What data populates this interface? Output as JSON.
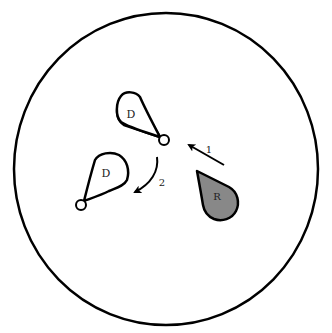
{
  "diagram": {
    "boundary": {
      "cx": 166,
      "cy": 169,
      "rx": 152,
      "ry": 156,
      "stroke": "#000000"
    },
    "shapes": [
      {
        "id": "D_upper",
        "label": "D",
        "fill": "#ffffff",
        "pivot": {
          "x": 163,
          "y": 140
        }
      },
      {
        "id": "D_lower",
        "label": "D",
        "fill": "#ffffff",
        "pivot": {
          "x": 81,
          "y": 205
        }
      },
      {
        "id": "R",
        "label": "R",
        "fill": "#888888"
      }
    ],
    "arrows": [
      {
        "id": "arrow_1",
        "label": "1",
        "type": "straight"
      },
      {
        "id": "arrow_2",
        "label": "2",
        "type": "curved"
      }
    ]
  },
  "labels": {
    "d_upper": "D",
    "d_lower": "D",
    "r": "R",
    "step1": "1",
    "step2": "2"
  }
}
